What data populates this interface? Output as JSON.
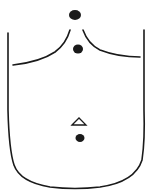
{
  "diagram": {
    "title": "",
    "stroke_color": "#1a1a1a",
    "background": "#ffffff",
    "points": [
      {
        "name": "top-dot",
        "x": 75,
        "y": 15,
        "r": 5
      },
      {
        "name": "sternal-notch-dot",
        "x": 78,
        "y": 50,
        "r": 4.5
      },
      {
        "name": "navel-dot",
        "x": 80,
        "y": 139,
        "r": 4
      }
    ],
    "markers": [
      {
        "name": "triangle-marker",
        "shape": "triangle",
        "x": 79,
        "y": 122
      }
    ]
  }
}
